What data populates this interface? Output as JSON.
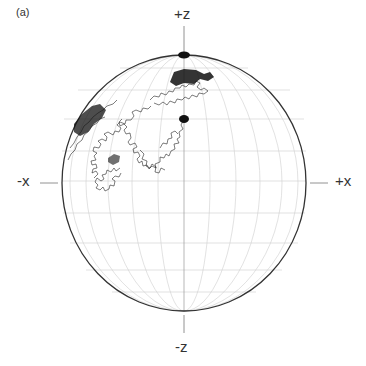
{
  "figure": {
    "panel_label": "(a)",
    "axes": {
      "plus_z": "+z",
      "minus_z": "-z",
      "minus_x": "-x",
      "plus_x": "+x"
    },
    "sphere": {
      "center": [
        184,
        183
      ],
      "rx": 122,
      "ry": 128,
      "outline_color": "#333333",
      "grid_color": "#c8c8c8"
    },
    "markers": [
      {
        "name": "north-pole-dot",
        "cx": 184,
        "cy": 55
      },
      {
        "name": "start-point-dot",
        "cx": 184,
        "cy": 119
      }
    ],
    "path_color": "#111111"
  }
}
